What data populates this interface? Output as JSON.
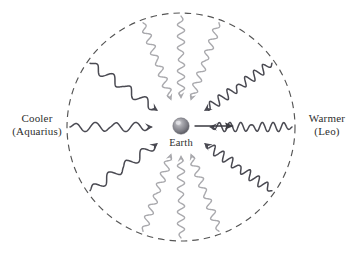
{
  "figure": {
    "background_color": "#ffffff"
  },
  "labels": {
    "left": {
      "line1": "Cooler",
      "line2": "(Aquarius)"
    },
    "right": {
      "line1": "Warmer",
      "line2": "(Leo)"
    },
    "center": {
      "line1": "Earth"
    }
  },
  "colors": {
    "dark_wave": "#4a4a52",
    "light_wave": "#a9a9ad",
    "dashed_circle": "#555555",
    "text": "#2e2e2e",
    "earth_body": "#8c8c92",
    "earth_highlight": "#d8d8dc",
    "earth_shadow": "#55555c",
    "motion_arrow": "#3a3a40"
  },
  "geometry": {
    "center_x": 181,
    "center_y": 127,
    "circle_radius": 114,
    "earth_radius": 8
  },
  "chart_data": {
    "type": "diagram",
    "center_object": "Earth",
    "boundary": {
      "shape": "circle",
      "style": "dashed",
      "meaning": "celestial sphere"
    },
    "motion_arrow": {
      "from": "Earth",
      "direction": "right (toward Leo / Warmer)",
      "style": "straight solid arrow"
    },
    "waves": [
      {
        "name": "left-horizontal",
        "angle_deg": 180,
        "tone": "dark",
        "cycles": 4.0,
        "wavelength": "long",
        "temperature": "cooler",
        "points_to": "Earth"
      },
      {
        "name": "upper-left-diagonal",
        "angle_deg": 145,
        "tone": "dark",
        "cycles": 4.0,
        "wavelength": "long",
        "temperature": "cooler",
        "points_to": "Earth"
      },
      {
        "name": "lower-left-diagonal",
        "angle_deg": 215,
        "tone": "dark",
        "cycles": 4.0,
        "wavelength": "long",
        "temperature": "cooler",
        "points_to": "Earth"
      },
      {
        "name": "top-left",
        "angle_deg": 110,
        "tone": "light",
        "cycles": 7.0,
        "wavelength": "intermediate",
        "temperature": "intermediate",
        "points_to": "Earth"
      },
      {
        "name": "top-center",
        "angle_deg": 90,
        "tone": "light",
        "cycles": 7.0,
        "wavelength": "intermediate",
        "temperature": "intermediate",
        "points_to": "Earth"
      },
      {
        "name": "top-right",
        "angle_deg": 70,
        "tone": "light",
        "cycles": 7.0,
        "wavelength": "intermediate",
        "temperature": "intermediate",
        "points_to": "Earth"
      },
      {
        "name": "bottom-left",
        "angle_deg": 250,
        "tone": "light",
        "cycles": 7.0,
        "wavelength": "intermediate",
        "temperature": "intermediate",
        "points_to": "Earth"
      },
      {
        "name": "bottom-center",
        "angle_deg": 270,
        "tone": "light",
        "cycles": 7.0,
        "wavelength": "intermediate",
        "temperature": "intermediate",
        "points_to": "Earth"
      },
      {
        "name": "bottom-right",
        "angle_deg": 290,
        "tone": "light",
        "cycles": 7.0,
        "wavelength": "intermediate",
        "temperature": "intermediate",
        "points_to": "Earth"
      },
      {
        "name": "right-horizontal",
        "angle_deg": 0,
        "tone": "dark",
        "cycles": 7.5,
        "wavelength": "short",
        "temperature": "warmer",
        "points_to": "Earth"
      },
      {
        "name": "upper-right-diagonal",
        "angle_deg": 35,
        "tone": "dark",
        "cycles": 7.5,
        "wavelength": "short",
        "temperature": "warmer",
        "points_to": "Earth"
      },
      {
        "name": "lower-right-diagonal",
        "angle_deg": 325,
        "tone": "dark",
        "cycles": 7.5,
        "wavelength": "short",
        "temperature": "warmer",
        "points_to": "Earth"
      }
    ]
  }
}
